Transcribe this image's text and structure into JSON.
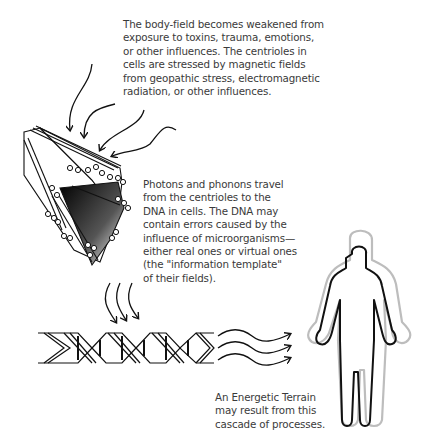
{
  "captions": {
    "body_field": "The body-field becomes weakened from\nexposure to toxins, trauma, emotions,\nor other influences. The centrioles in\ncells are stressed by magnetic fields\nfrom geopathic stress, electromagnetic\nradiation, or other influences.",
    "photons": "Photons and phonons travel\nfrom the centrioles to the\nDNA in cells. The DNA may\ncontain errors caused by the\ninfluence of microorganisms—\neither real ones or virtual ones\n(the \"information template\"\nof their fields).",
    "terrain": "An Energetic Terrain\nmay result from this\ncascade of processes."
  },
  "figures": [
    "incoming-field-arrows",
    "centriole",
    "photon-arrows",
    "dna-helix",
    "transmission-arrows",
    "human-body-with-aura"
  ],
  "colors": {
    "ink": "#111111",
    "text": "#3a3a3a",
    "aura": "#bdbdbd",
    "background": "#ffffff"
  }
}
